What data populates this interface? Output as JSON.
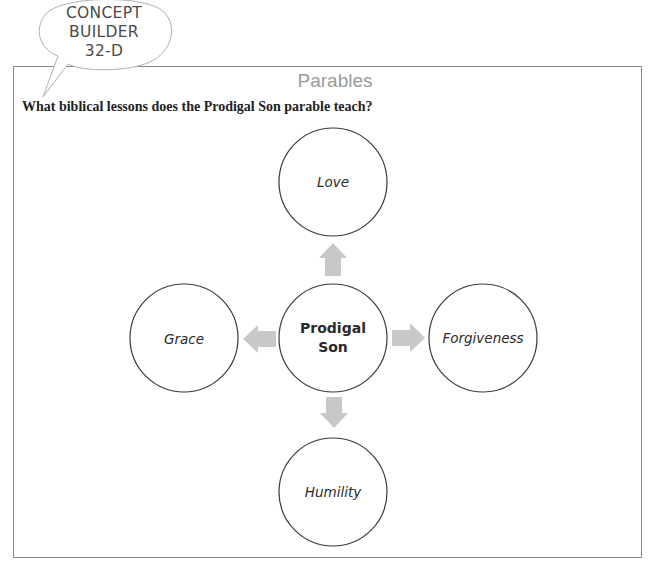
{
  "badge": {
    "line1": "CONCEPT",
    "line2": "BUILDER",
    "line3": "32-D"
  },
  "section": {
    "title": "Parables"
  },
  "question": {
    "text": "What biblical lessons does the Prodigal Son parable teach?"
  },
  "diagram": {
    "center": {
      "line1": "Prodigal",
      "line2": "Son"
    },
    "nodes": {
      "top": "Love",
      "left": "Grace",
      "right": "Forgiveness",
      "bottom": "Humility"
    },
    "colors": {
      "circle_stroke": "#3a3a3a",
      "arrow_fill": "#c8c8c8",
      "frame_stroke": "#8a8a8a",
      "title_color": "#9a9a9a"
    }
  }
}
